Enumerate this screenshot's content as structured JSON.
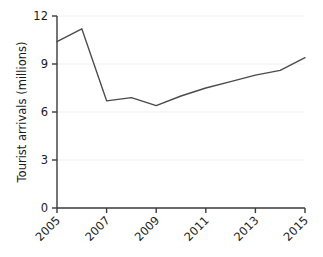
{
  "chart_data": {
    "type": "line",
    "title": "",
    "subtitle": "",
    "xlabel": "",
    "ylabel": "Tourist arrivals (millions)",
    "x": [
      2005,
      2006,
      2007,
      2008,
      2009,
      2010,
      2011,
      2012,
      2013,
      2014,
      2015
    ],
    "values": [
      10.4,
      11.2,
      6.7,
      6.9,
      6.4,
      7.0,
      7.5,
      7.9,
      8.3,
      8.6,
      9.4
    ],
    "series": [
      {
        "name": "Tourist arrivals",
        "values": [
          10.4,
          11.2,
          6.7,
          6.9,
          6.4,
          7.0,
          7.5,
          7.9,
          8.3,
          8.6,
          9.4
        ]
      }
    ],
    "xlim": [
      2005,
      2015
    ],
    "ylim": [
      0,
      12
    ],
    "ytick_labels": [
      "0",
      "3",
      "6",
      "9",
      "12"
    ],
    "ytick_values": [
      0,
      3,
      6,
      9,
      12
    ],
    "xtick_labels": [
      "2005",
      "2007",
      "2009",
      "2011",
      "2013",
      "2015"
    ],
    "xtick_values": [
      2005,
      2007,
      2009,
      2011,
      2013,
      2015
    ],
    "grid": "horizontal",
    "legend": "none",
    "annotations": [],
    "colors": {
      "line": "#4a4a4a",
      "grid": "#efefef",
      "axis": "#3a3a3a",
      "text": "#1a1a1a",
      "background": "#ffffff"
    }
  }
}
